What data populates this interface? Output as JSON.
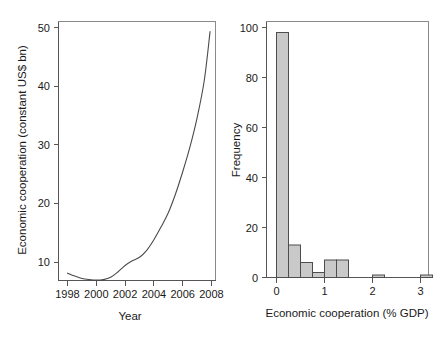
{
  "figure": {
    "background": "#ffffff",
    "panel_count": 2
  },
  "chart_data": [
    {
      "type": "line",
      "title": "",
      "xlabel": "Year",
      "ylabel": "Economic cooperation (constant US$ bn)",
      "xlim": [
        1997.4,
        2008.3
      ],
      "ylim": [
        6.2,
        51.0
      ],
      "xticks": [
        1998,
        2000,
        2002,
        2004,
        2006,
        2008
      ],
      "xtick_labels": [
        "1998",
        "2000",
        "2002",
        "2004",
        "2006",
        "2008"
      ],
      "yticks": [
        10,
        20,
        30,
        40,
        50
      ],
      "ytick_labels": [
        "10",
        "20",
        "30",
        "40",
        "50"
      ],
      "grid": false,
      "legend": "none",
      "line_color": "#4a4a4a",
      "x": [
        1998.0,
        1998.5,
        1999.0,
        1999.5,
        2000.0,
        2000.5,
        2001.0,
        2001.5,
        2002.0,
        2002.5,
        2003.0,
        2003.5,
        2004.0,
        2004.5,
        2005.0,
        2005.5,
        2006.0,
        2006.5,
        2007.0,
        2007.5,
        2007.9
      ],
      "values": [
        8.1,
        7.6,
        7.2,
        7.0,
        6.9,
        7.0,
        7.4,
        8.3,
        9.4,
        10.2,
        10.8,
        12.0,
        13.8,
        16.0,
        18.4,
        21.6,
        25.4,
        29.6,
        34.6,
        41.0,
        49.3
      ]
    },
    {
      "type": "bar",
      "title": "",
      "xlabel": "Economic cooperation (% GDP)",
      "ylabel": "Frequency",
      "xlim": [
        -0.22,
        3.35
      ],
      "ylim": [
        0,
        101
      ],
      "xticks": [
        0,
        1,
        2,
        3
      ],
      "xtick_labels": [
        "0",
        "1",
        "2",
        "3"
      ],
      "yticks": [
        0,
        20,
        40,
        60,
        80,
        100
      ],
      "ytick_labels": [
        "0",
        "20",
        "40",
        "60",
        "80",
        "100"
      ],
      "grid": false,
      "legend": "none",
      "bar_fill": "#c9c9c9",
      "bar_edge": "#4d4d4d",
      "bin_width": 0.25,
      "bin_starts": [
        0.0,
        0.25,
        0.5,
        0.75,
        1.0,
        1.25,
        2.0,
        3.0
      ],
      "categories": [
        "0-0.25",
        "0.25-0.5",
        "0.5-0.75",
        "0.75-1.0",
        "1.0-1.25",
        "1.25-1.5",
        "2.0-2.25",
        "3.0-3.25"
      ],
      "values": [
        98,
        13,
        6,
        2,
        7,
        7,
        1,
        1
      ]
    }
  ],
  "panels": {
    "line_panel": {
      "name": "economic-cooperation-over-time",
      "ylabel": "Economic cooperation (constant US$ bn)",
      "xlabel": "Year"
    },
    "hist_panel": {
      "name": "economic-cooperation-distribution",
      "ylabel": "Frequency",
      "xlabel": "Economic cooperation (% GDP)"
    }
  }
}
